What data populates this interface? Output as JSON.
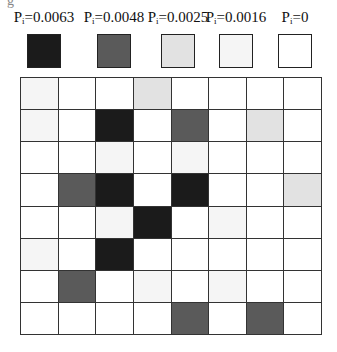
{
  "crop_fragment": "g",
  "chart_data": {
    "type": "heatmap",
    "title": "",
    "rows": 8,
    "cols": 8,
    "legend": [
      {
        "label_base": "P",
        "label_sub": "i",
        "label_value": "=0.0063",
        "value": 0.0063,
        "color": "#1b1b1b"
      },
      {
        "label_base": "P",
        "label_sub": "i",
        "label_value": "=0.0048",
        "value": 0.0048,
        "color": "#5a5a5a"
      },
      {
        "label_base": "P",
        "label_sub": "i",
        "label_value": "=0.0025",
        "value": 0.0025,
        "color": "#e2e2e2"
      },
      {
        "label_base": "P",
        "label_sub": "i",
        "label_value": "=0.0016",
        "value": 0.0016,
        "color": "#f5f5f5"
      },
      {
        "label_base": "P",
        "label_sub": "i",
        "label_value": "=0",
        "value": 0,
        "color": "#ffffff"
      }
    ],
    "values": [
      [
        0.0016,
        0,
        0,
        0.0025,
        0,
        0,
        0,
        0
      ],
      [
        0.0016,
        0,
        0.0063,
        0,
        0.0048,
        0,
        0.0025,
        0
      ],
      [
        0,
        0,
        0.0016,
        0,
        0.0016,
        0,
        0,
        0
      ],
      [
        0,
        0.0048,
        0.0063,
        0,
        0.0063,
        0,
        0,
        0.0025
      ],
      [
        0,
        0,
        0.0016,
        0.0063,
        0,
        0.0016,
        0,
        0
      ],
      [
        0.0016,
        0,
        0.0063,
        0,
        0,
        0,
        0,
        0
      ],
      [
        0,
        0.0048,
        0,
        0.0016,
        0,
        0.0016,
        0,
        0
      ],
      [
        0,
        0,
        0,
        0,
        0.0048,
        0,
        0.0048,
        0
      ]
    ]
  }
}
